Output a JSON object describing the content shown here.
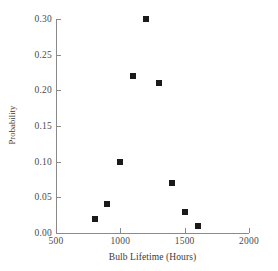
{
  "chart_data": {
    "type": "scatter",
    "title": "",
    "xlabel": "Bulb Lifetime (Hours)",
    "ylabel": "Probability",
    "xlim": [
      500,
      2000
    ],
    "ylim": [
      0.0,
      0.3
    ],
    "grid": false,
    "legend": null,
    "marker": "square",
    "marker_color": "#1a1a1a",
    "axis_color": "#8a8a8a",
    "background_color": "#ffffff",
    "x": [
      800,
      900,
      1000,
      1100,
      1200,
      1300,
      1400,
      1500,
      1600
    ],
    "y": [
      0.02,
      0.04,
      0.1,
      0.22,
      0.3,
      0.21,
      0.07,
      0.03,
      0.01
    ],
    "points": [
      {
        "x": 800,
        "y": 0.02
      },
      {
        "x": 900,
        "y": 0.04
      },
      {
        "x": 1000,
        "y": 0.1
      },
      {
        "x": 1100,
        "y": 0.22
      },
      {
        "x": 1200,
        "y": 0.3
      },
      {
        "x": 1300,
        "y": 0.21
      },
      {
        "x": 1400,
        "y": 0.07
      },
      {
        "x": 1500,
        "y": 0.03
      },
      {
        "x": 1600,
        "y": 0.01
      }
    ],
    "xticks": [
      500,
      1000,
      1500,
      2000
    ],
    "xtick_labels": [
      "500",
      "1000",
      "1500",
      "2000"
    ],
    "yticks": [
      0.0,
      0.05,
      0.1,
      0.15,
      0.2,
      0.25,
      0.3
    ],
    "ytick_labels": [
      "0.00",
      "0.05",
      "0.10",
      "0.15",
      "0.20",
      "0.25",
      "0.30"
    ]
  }
}
